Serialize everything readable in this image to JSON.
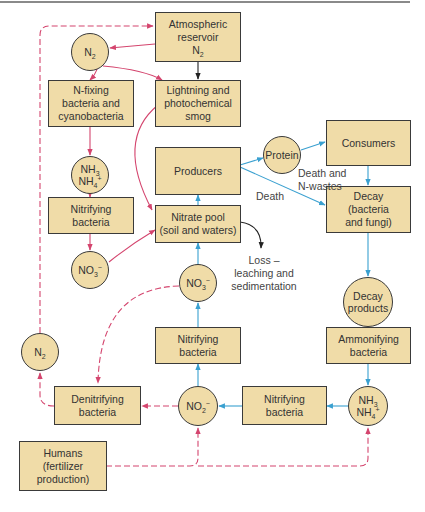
{
  "colors": {
    "box_fill": "#f0dca8",
    "box_border": "#3a3a3a",
    "red_arrow": "#d4456e",
    "blue_arrow": "#3aa0d0",
    "black_arrow": "#222222"
  },
  "nodes": {
    "atmospheric_reservoir": {
      "line1": "Atmospheric",
      "line2": "reservoir",
      "formula": "N",
      "sub": "2"
    },
    "n2_top": {
      "formula": "N",
      "sub": "2"
    },
    "n_fixing": {
      "text": "N-fixing\nbacteria and\ncyanobacteria"
    },
    "lightning": {
      "text": "Lightning and\nphotochemical\nsmog"
    },
    "nh3_left": {
      "l1": "NH",
      "l1sub": "3",
      "l2": "NH",
      "l2sub": "4",
      "l2sup": "+"
    },
    "producers": {
      "text": "Producers"
    },
    "protein": {
      "text": "Protein"
    },
    "consumers": {
      "text": "Consumers"
    },
    "nitrifying_left": {
      "text": "Nitrifying\nbacteria"
    },
    "nitrate_pool": {
      "text": "Nitrate pool\n(soil and waters)"
    },
    "decay": {
      "text": "Decay\n(bacteria\nand fungi)"
    },
    "no3_left": {
      "formula": "NO",
      "sub": "3",
      "sup": "−"
    },
    "no3_mid": {
      "formula": "NO",
      "sub": "3",
      "sup": "−"
    },
    "decay_products": {
      "text": "Decay\nproducts"
    },
    "nitrifying_mid": {
      "text": "Nitrifying\nbacteria"
    },
    "ammonifying": {
      "text": "Ammonifying\nbacteria"
    },
    "n2_left": {
      "formula": "N",
      "sub": "2"
    },
    "denitrifying": {
      "text": "Denitrifying\nbacteria"
    },
    "no2": {
      "formula": "NO",
      "sub": "2",
      "sup": "−"
    },
    "nitrifying_bottom": {
      "text": "Nitrifying\nbacteria"
    },
    "nh3_bottom": {
      "l1": "NH",
      "l1sub": "3",
      "l2": "NH",
      "l2sub": "4",
      "l2sup": "+"
    },
    "humans": {
      "text": "Humans\n(fertilizer\nproduction)"
    }
  },
  "edge_labels": {
    "death_and_nwastes": "Death and\nN-wastes",
    "death": "Death",
    "loss": "Loss –\nleaching and\nsedimentation"
  }
}
